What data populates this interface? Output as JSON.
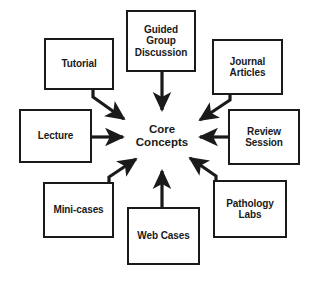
{
  "diagram": {
    "type": "hub-and-spoke",
    "background_color": "#ffffff",
    "line_color": "#1a1a1a",
    "text_color": "#1a1a1a",
    "hub": {
      "label": "Core\nConcepts",
      "name": "core-concepts-hub"
    },
    "nodes": [
      {
        "id": "tutorial",
        "label": "Tutorial",
        "name": "node-tutorial",
        "position": "top-left",
        "box": {
          "x": 44,
          "y": 38,
          "w": 70,
          "h": 52
        },
        "arrow": "diagonal-down-right"
      },
      {
        "id": "guided-group-discussion",
        "label": "Guided\nGroup\nDiscussion",
        "name": "node-guided-group-discussion",
        "position": "top",
        "box": {
          "x": 126,
          "y": 10,
          "w": 70,
          "h": 62
        },
        "arrow": "down"
      },
      {
        "id": "journal-articles",
        "label": "Journal\nArticles",
        "name": "node-journal-articles",
        "position": "top-right",
        "box": {
          "x": 212,
          "y": 39,
          "w": 71,
          "h": 56
        },
        "arrow": "diagonal-down-left"
      },
      {
        "id": "lecture",
        "label": "Lecture",
        "name": "node-lecture",
        "position": "left",
        "box": {
          "x": 19,
          "y": 109,
          "w": 73,
          "h": 54
        },
        "arrow": "right"
      },
      {
        "id": "review-session",
        "label": "Review\nSession",
        "name": "node-review-session",
        "position": "right",
        "box": {
          "x": 228,
          "y": 109,
          "w": 72,
          "h": 56
        },
        "arrow": "left"
      },
      {
        "id": "mini-cases",
        "label": "Mini-cases",
        "name": "node-mini-cases",
        "position": "bottom-left",
        "box": {
          "x": 43,
          "y": 182,
          "w": 71,
          "h": 56
        },
        "arrow": "diagonal-up-right"
      },
      {
        "id": "web-cases",
        "label": "Web Cases",
        "name": "node-web-cases",
        "position": "bottom",
        "box": {
          "x": 127,
          "y": 207,
          "w": 73,
          "h": 58
        },
        "arrow": "up"
      },
      {
        "id": "pathology-labs",
        "label": "Pathology\nLabs",
        "name": "node-pathology-labs",
        "position": "bottom-right",
        "box": {
          "x": 213,
          "y": 180,
          "w": 74,
          "h": 58
        },
        "arrow": "diagonal-up-left"
      }
    ]
  }
}
